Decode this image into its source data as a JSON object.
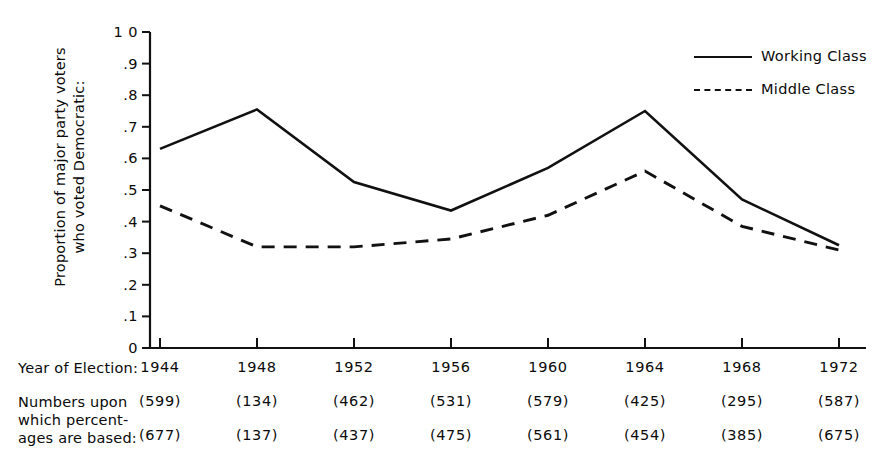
{
  "chart_data": {
    "type": "line",
    "title": "",
    "xlabel": "Year of Election:",
    "ylabel": "Proportion of major party voters who voted Democratic:",
    "ylabel_line1": "Proportion of major party voters",
    "ylabel_line2": "who voted Democratic:",
    "categories": [
      "1944",
      "1948",
      "1952",
      "1956",
      "1960",
      "1964",
      "1968",
      "1972"
    ],
    "ylim": [
      0,
      1.0
    ],
    "ytick_labels": [
      "1 0",
      ".9",
      ".8",
      ".7",
      ".6",
      ".5",
      ".4",
      ".3",
      ".2",
      ".1",
      "0"
    ],
    "ytick_values": [
      1.0,
      0.9,
      0.8,
      0.7,
      0.6,
      0.5,
      0.4,
      0.3,
      0.2,
      0.1,
      0.0
    ],
    "grid": false,
    "legend_position": "top-right",
    "series": [
      {
        "name": "Working Class",
        "style": "solid",
        "color": "#111111",
        "values": [
          0.63,
          0.755,
          0.525,
          0.435,
          0.57,
          0.75,
          0.47,
          0.325
        ]
      },
      {
        "name": "Middle Class",
        "style": "dashed",
        "color": "#111111",
        "values": [
          0.45,
          0.32,
          0.32,
          0.345,
          0.42,
          0.56,
          0.385,
          0.31
        ]
      }
    ],
    "table": {
      "row_labels": [
        "Year of Election:",
        "Numbers upon",
        "which percent-",
        "ages are based:"
      ],
      "note_label_line1": "Numbers upon",
      "note_label_line2": "which percent-",
      "note_label_line3": "ages are based:",
      "rows": [
        {
          "series": "Working Class",
          "values": [
            "(599)",
            "(134)",
            "(462)",
            "(531)",
            "(579)",
            "(425)",
            "(295)",
            "(587)"
          ]
        },
        {
          "series": "Middle Class",
          "values": [
            "(677)",
            "(137)",
            "(437)",
            "(475)",
            "(561)",
            "(454)",
            "(385)",
            "(675)"
          ]
        }
      ]
    }
  }
}
